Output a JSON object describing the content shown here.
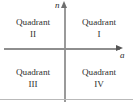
{
  "figure": {
    "type": "coordinate-plane-quadrant-diagram",
    "background_color": "#ffffff",
    "axes": {
      "vertical_label": "n",
      "horizontal_label": "a",
      "axis_color": "#9a9a9a",
      "arrow_color": "#6e6e6e"
    },
    "quadrants": [
      {
        "key": "q1",
        "name": "Quadrant",
        "numeral": "I",
        "position": "top-right"
      },
      {
        "key": "q2",
        "name": "Quadrant",
        "numeral": "II",
        "position": "top-left"
      },
      {
        "key": "q3",
        "name": "Quadrant",
        "numeral": "III",
        "position": "bottom-left"
      },
      {
        "key": "q4",
        "name": "Quadrant",
        "numeral": "IV",
        "position": "bottom-right"
      }
    ],
    "rule_color": "#b9b9b9",
    "text_color": "#303030"
  }
}
